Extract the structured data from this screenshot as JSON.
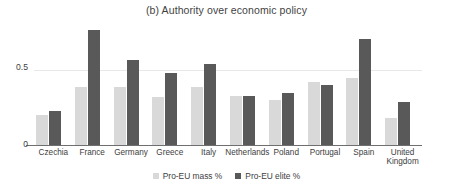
{
  "chart_data": {
    "type": "bar",
    "title": "(b) Authority over economic policy",
    "xlabel": "",
    "ylabel": "",
    "ylim": [
      0,
      0.82
    ],
    "yticks": [
      0,
      0.5
    ],
    "ytick_labels": [
      "0",
      "0.5"
    ],
    "grid": true,
    "legend_position": "bottom",
    "categories": [
      "Czechia",
      "France",
      "Germany",
      "Greece",
      "Italy",
      "Netherlands",
      "Poland",
      "Portugal",
      "Spain",
      "United\nKingdom"
    ],
    "series": [
      {
        "name": "Pro-EU mass %",
        "color": "#d9d9d9",
        "values": [
          0.2,
          0.39,
          0.39,
          0.32,
          0.39,
          0.33,
          0.3,
          0.42,
          0.45,
          0.18
        ]
      },
      {
        "name": "Pro-EU elite %",
        "color": "#595959",
        "values": [
          0.23,
          0.77,
          0.57,
          0.48,
          0.54,
          0.33,
          0.35,
          0.4,
          0.71,
          0.29
        ]
      }
    ]
  },
  "legend": {
    "items": [
      {
        "label": "Pro-EU mass %",
        "color": "#d9d9d9"
      },
      {
        "label": "Pro-EU elite %",
        "color": "#595959"
      }
    ]
  }
}
